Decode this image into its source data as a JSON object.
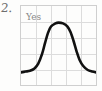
{
  "page": {
    "background_color": "#fdfdfc",
    "item_number": "2."
  },
  "plot": {
    "series_label": "Yes",
    "grid_color": "#dcdcdc",
    "border_color": "#cfcfcf",
    "curve_color": "#111111",
    "columns": 5,
    "rows": 5
  },
  "chart_data": {
    "type": "line",
    "title": "",
    "subtitle": "",
    "xlabel": "",
    "ylabel": "",
    "annotations": [
      "Yes"
    ],
    "grid": true,
    "legend": "none",
    "xlim": [
      0,
      10
    ],
    "ylim": [
      0,
      10
    ],
    "series": [
      {
        "name": "Yes",
        "x": [
          0.0,
          0.6,
          1.2,
          1.8,
          2.3,
          2.8,
          3.2,
          3.6,
          4.0,
          4.6,
          5.0,
          5.6,
          6.2,
          6.6,
          7.0,
          7.4,
          7.8,
          8.3,
          8.9,
          9.5,
          10.0
        ],
        "y": [
          1.6,
          1.7,
          1.8,
          2.1,
          2.7,
          3.9,
          5.3,
          6.6,
          7.4,
          7.8,
          7.9,
          7.8,
          7.4,
          6.7,
          5.6,
          4.3,
          3.2,
          2.4,
          1.9,
          1.7,
          1.6
        ]
      }
    ]
  }
}
